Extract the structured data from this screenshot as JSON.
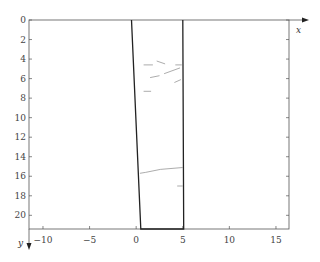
{
  "chart_data": {
    "type": "line",
    "title": "",
    "xlabel": "x",
    "ylabel": "y",
    "y_inverted": true,
    "xlim": [
      -11.5,
      16.4
    ],
    "ylim": [
      0,
      21.4
    ],
    "x_ticks": [
      -10,
      -5,
      0,
      5,
      10,
      15
    ],
    "x_tick_labels": [
      "−10",
      "−5",
      "0",
      "5",
      "10",
      "15"
    ],
    "y_ticks": [
      0,
      2,
      4,
      6,
      8,
      10,
      12,
      14,
      16,
      18,
      20
    ],
    "y_tick_labels": [
      "0",
      "2",
      "4",
      "6",
      "8",
      "10",
      "12",
      "14",
      "16",
      "18",
      "20"
    ],
    "grid": false,
    "legend": null,
    "series": [
      {
        "name": "boundary",
        "style": "thick",
        "points": [
          [
            -0.5,
            0
          ],
          [
            0.5,
            21.4
          ],
          [
            5.1,
            21.4
          ],
          [
            5.0,
            0
          ]
        ]
      },
      {
        "name": "fracture-1",
        "style": "thin",
        "points": [
          [
            0.8,
            4.6
          ],
          [
            1.8,
            4.6
          ]
        ]
      },
      {
        "name": "fracture-2",
        "style": "thin",
        "points": [
          [
            2.2,
            4.2
          ],
          [
            3.1,
            4.5
          ]
        ]
      },
      {
        "name": "fracture-3",
        "style": "thin",
        "points": [
          [
            4.2,
            4.6
          ],
          [
            4.9,
            4.6
          ]
        ]
      },
      {
        "name": "fracture-4",
        "style": "thin",
        "points": [
          [
            1.5,
            5.9
          ],
          [
            2.5,
            5.7
          ]
        ]
      },
      {
        "name": "fracture-5",
        "style": "thin",
        "points": [
          [
            3.0,
            5.5
          ],
          [
            4.7,
            4.9
          ]
        ]
      },
      {
        "name": "fracture-6",
        "style": "thin",
        "points": [
          [
            4.1,
            6.4
          ],
          [
            4.8,
            6.1
          ]
        ]
      },
      {
        "name": "fracture-7",
        "style": "thin",
        "points": [
          [
            0.8,
            7.3
          ],
          [
            1.6,
            7.3
          ]
        ]
      },
      {
        "name": "fracture-8",
        "style": "thin",
        "points": [
          [
            0.4,
            15.7
          ],
          [
            1.0,
            15.6
          ],
          [
            2.6,
            15.3
          ],
          [
            5.0,
            15.1
          ]
        ]
      },
      {
        "name": "fracture-9",
        "style": "thin",
        "points": [
          [
            4.4,
            17.0
          ],
          [
            5.0,
            17.0
          ]
        ]
      }
    ]
  }
}
